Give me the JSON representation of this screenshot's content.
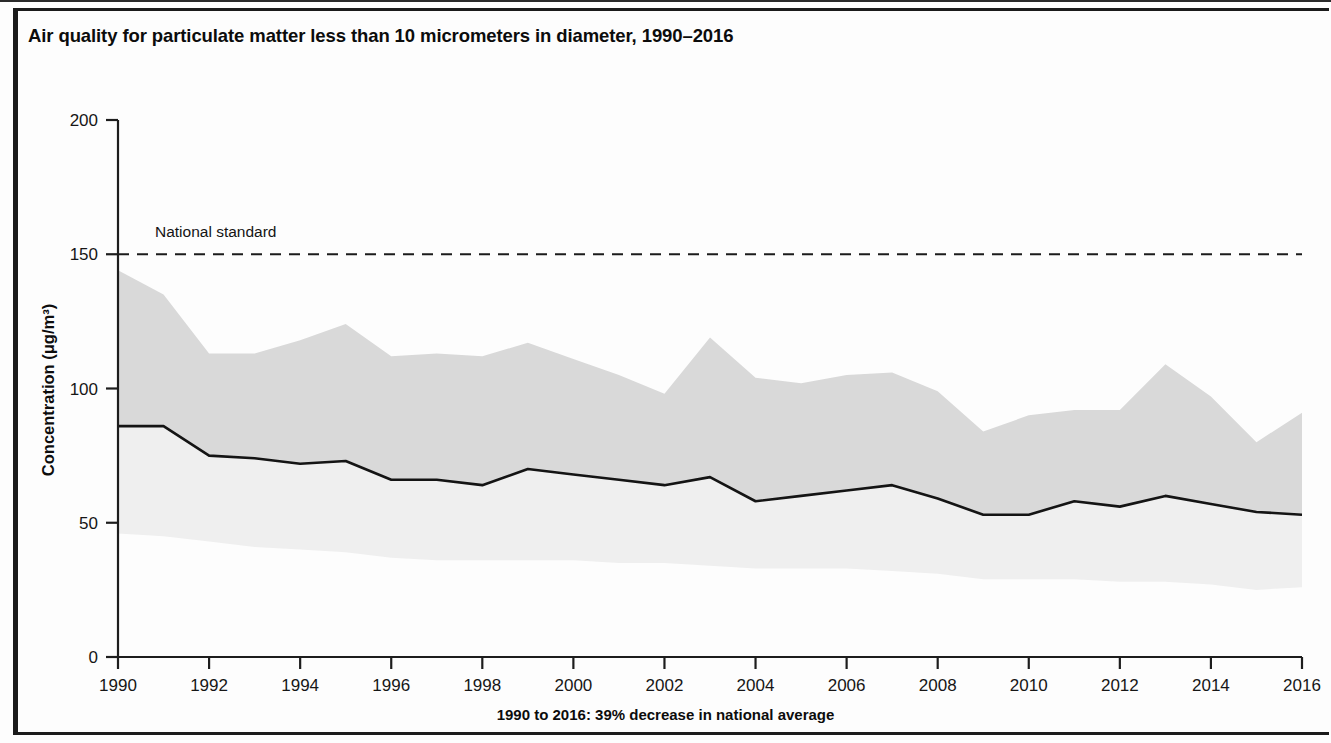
{
  "figure": {
    "title": "Air quality for particulate matter less than 10 micrometers in diameter, 1990–2016",
    "footnote": "1990 to 2016: 39% decrease in national average"
  },
  "annotations": {
    "national_standard_label": "National standard"
  },
  "axes": {
    "y_label": "Concentration (μg/m³)",
    "y_ticks": [
      "0",
      "50",
      "100",
      "150",
      "200"
    ],
    "x_ticks": [
      "1990",
      "1992",
      "1994",
      "1996",
      "1998",
      "2000",
      "2002",
      "2004",
      "2006",
      "2008",
      "2010",
      "2012",
      "2014",
      "2016"
    ]
  },
  "colors": {
    "band_upper": "#d9d9d9",
    "band_lower": "#efefef",
    "mean_line": "#141414",
    "standard_line": "#1b1b1b",
    "axis": "#1d1d1d",
    "frame": "#1b1b1b",
    "background": "#fdfdfd"
  },
  "chart_data": {
    "type": "area",
    "title": "Air quality for particulate matter less than 10 micrometers in diameter, 1990–2016",
    "xlabel": "",
    "ylabel": "Concentration (μg/m³)",
    "xlim": [
      1990,
      2016
    ],
    "ylim": [
      0,
      200
    ],
    "ytick_interval": 50,
    "xtick_interval": 2,
    "grid": false,
    "legend": "none",
    "x": [
      1990,
      1991,
      1992,
      1993,
      1994,
      1995,
      1996,
      1997,
      1998,
      1999,
      2000,
      2001,
      2002,
      2003,
      2004,
      2005,
      2006,
      2007,
      2008,
      2009,
      2010,
      2011,
      2012,
      2013,
      2014,
      2015,
      2016
    ],
    "series": [
      {
        "name": "90th percentile",
        "role": "band_upper",
        "values": [
          144,
          135,
          113,
          113,
          118,
          124,
          112,
          113,
          112,
          117,
          111,
          105,
          98,
          119,
          104,
          102,
          105,
          106,
          99,
          84,
          90,
          92,
          92,
          109,
          97,
          80,
          91
        ]
      },
      {
        "name": "National average",
        "role": "mean_line",
        "values": [
          86,
          86,
          75,
          74,
          72,
          73,
          66,
          66,
          64,
          70,
          68,
          66,
          64,
          67,
          58,
          60,
          62,
          64,
          59,
          53,
          53,
          58,
          56,
          60,
          57,
          54,
          53
        ]
      },
      {
        "name": "10th percentile",
        "role": "band_lower",
        "values": [
          46,
          45,
          43,
          41,
          40,
          39,
          37,
          36,
          36,
          36,
          36,
          35,
          35,
          34,
          33,
          33,
          33,
          32,
          31,
          29,
          29,
          29,
          28,
          28,
          27,
          25,
          26
        ]
      }
    ],
    "reference_lines": [
      {
        "name": "National standard",
        "value": 150,
        "style": "dashed",
        "label": "National standard"
      }
    ],
    "summary": "1990 to 2016: 39% decrease in national average"
  }
}
